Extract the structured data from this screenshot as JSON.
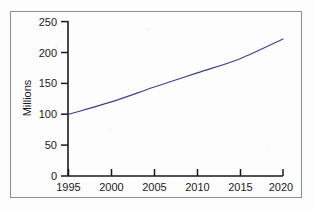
{
  "chart_data": {
    "type": "line",
    "title": "",
    "xlabel": "",
    "ylabel": "Millions",
    "x": [
      1995,
      2000,
      2005,
      2010,
      2015,
      2020
    ],
    "values": [
      100,
      120,
      144,
      167,
      190,
      222
    ],
    "series": [
      {
        "name": "Population",
        "values": [
          100,
          120,
          144,
          167,
          190,
          222
        ]
      }
    ],
    "xlim": [
      1995,
      2020
    ],
    "ylim": [
      0,
      250
    ],
    "xticks": [
      1995,
      2000,
      2005,
      2010,
      2015,
      2020
    ],
    "yticks": [
      0,
      50,
      100,
      150,
      200,
      250
    ],
    "xtick_labels": [
      "1995",
      "2000",
      "2005",
      "2010",
      "2015",
      "2020"
    ],
    "ytick_labels": [
      "0",
      "50",
      "100",
      "150",
      "200",
      "250"
    ],
    "grid": false,
    "legend": false,
    "legend_position": "none",
    "line_color": "#3b3f8c",
    "axis_color": "#1a1a1a",
    "border_color": "#8d8d8d",
    "background_color": "#fdfdfd"
  },
  "axes": {
    "y_axis_title": "Millions",
    "x_axis_title": ""
  }
}
